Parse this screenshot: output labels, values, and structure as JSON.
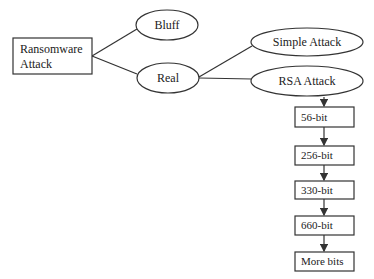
{
  "diagram": {
    "type": "flow-tree",
    "root": {
      "label_line1": "Ransomware",
      "label_line2": "Attack"
    },
    "branches": {
      "bluff": "Bluff",
      "real": "Real"
    },
    "real_children": {
      "simple": "Simple Attack",
      "rsa": "RSA Attack"
    },
    "rsa_chain": [
      "56-bit",
      "256-bit",
      "330-bit",
      "660-bit",
      "More bits"
    ],
    "colors": {
      "stroke": "#333333",
      "fill": "#ffffff",
      "text": "#222222"
    }
  }
}
